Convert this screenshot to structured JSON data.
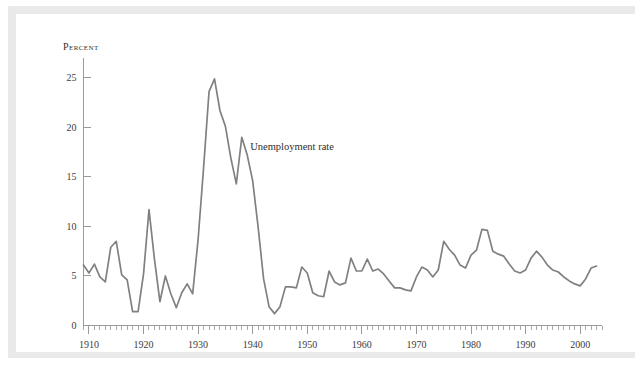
{
  "figure": {
    "background_color": "#ffffff",
    "frame_color": "#e9e9e9",
    "plate_color": "#ffffff"
  },
  "chart_data": {
    "type": "line",
    "title": "",
    "subtitle": "",
    "xlabel": "",
    "ylabel": "Percent",
    "ylabel_style": "small-caps",
    "annotation": "Unemployment rate",
    "annotation_x": 1939,
    "annotation_y": 18.0,
    "legend": "none",
    "legend_position": "inline-annotation",
    "grid": false,
    "line_color": "#808080",
    "axis_color": "#9a9a9a",
    "text_color": "#3c3c3c",
    "xlim": [
      1909,
      2004
    ],
    "ylim": [
      0,
      27
    ],
    "y_ticks": [
      0,
      5,
      10,
      15,
      20,
      25
    ],
    "y_tick_labels": [
      "0",
      "5",
      "10",
      "15",
      "20",
      "25"
    ],
    "x_major_ticks": [
      1910,
      1920,
      1930,
      1940,
      1950,
      1960,
      1970,
      1980,
      1990,
      2000
    ],
    "x_tick_labels": [
      "1910",
      "1920",
      "1930",
      "1940",
      "1950",
      "1960",
      "1970",
      "1980",
      "1990",
      "2000"
    ],
    "x_minor_tick_interval": 1,
    "series": [
      {
        "name": "Unemployment rate",
        "x": [
          1909,
          1910,
          1911,
          1912,
          1913,
          1914,
          1915,
          1916,
          1917,
          1918,
          1919,
          1920,
          1921,
          1922,
          1923,
          1924,
          1925,
          1926,
          1927,
          1928,
          1929,
          1930,
          1931,
          1932,
          1933,
          1934,
          1935,
          1936,
          1937,
          1938,
          1939,
          1940,
          1941,
          1942,
          1943,
          1944,
          1945,
          1946,
          1947,
          1948,
          1949,
          1950,
          1951,
          1952,
          1953,
          1954,
          1955,
          1956,
          1957,
          1958,
          1959,
          1960,
          1961,
          1962,
          1963,
          1964,
          1965,
          1966,
          1967,
          1968,
          1969,
          1970,
          1971,
          1972,
          1973,
          1974,
          1975,
          1976,
          1977,
          1978,
          1979,
          1980,
          1981,
          1982,
          1983,
          1984,
          1985,
          1986,
          1987,
          1988,
          1989,
          1990,
          1991,
          1992,
          1993,
          1994,
          1995,
          1996,
          1997,
          1998,
          1999,
          2000,
          2001,
          2002,
          2003
        ],
        "values": [
          6.1,
          5.3,
          6.2,
          4.9,
          4.4,
          7.9,
          8.5,
          5.1,
          4.6,
          1.4,
          1.4,
          5.2,
          11.7,
          6.7,
          2.4,
          5.0,
          3.2,
          1.8,
          3.3,
          4.2,
          3.2,
          8.7,
          15.9,
          23.6,
          24.9,
          21.7,
          20.1,
          16.9,
          14.3,
          19.0,
          17.2,
          14.6,
          9.9,
          4.7,
          1.9,
          1.2,
          1.9,
          3.9,
          3.9,
          3.8,
          5.9,
          5.3,
          3.3,
          3.0,
          2.9,
          5.5,
          4.4,
          4.1,
          4.3,
          6.8,
          5.5,
          5.5,
          6.7,
          5.5,
          5.7,
          5.2,
          4.5,
          3.8,
          3.8,
          3.6,
          3.5,
          4.9,
          5.9,
          5.6,
          4.9,
          5.6,
          8.5,
          7.7,
          7.1,
          6.1,
          5.8,
          7.1,
          7.6,
          9.7,
          9.6,
          7.5,
          7.2,
          7.0,
          6.2,
          5.5,
          5.3,
          5.6,
          6.8,
          7.5,
          6.9,
          6.1,
          5.6,
          5.4,
          4.9,
          4.5,
          4.2,
          4.0,
          4.7,
          5.8,
          6.0
        ]
      }
    ]
  }
}
